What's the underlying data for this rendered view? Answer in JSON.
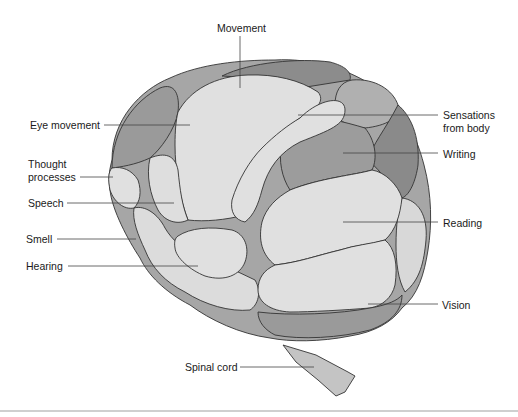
{
  "diagram": {
    "colors": {
      "light_region": "#e2e2e2",
      "medium_region": "#a9a9a9",
      "dark_region": "#8e8e8e",
      "outline": "#333333",
      "leader_line": "#444444",
      "text": "#1a1a1a"
    },
    "labels": {
      "movement": "Movement",
      "eye_movement": "Eye movement",
      "thought_line1": "Thought",
      "thought_line2": "processes",
      "speech": "Speech",
      "smell": "Smell",
      "hearing": "Hearing",
      "spinal_cord": "Spinal cord",
      "sensations_line1": "Sensations",
      "sensations_line2": "from body",
      "writing": "Writing",
      "reading": "Reading",
      "vision": "Vision"
    }
  }
}
